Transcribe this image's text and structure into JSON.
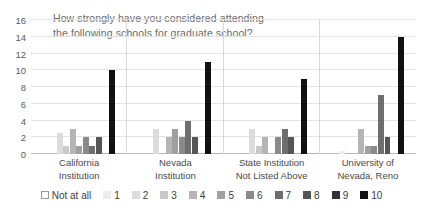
{
  "chart_data": {
    "type": "bar",
    "title": "How strongly have you considered attending\nthe following schools for graduate school?",
    "xlabel": "",
    "ylabel": "",
    "ylim": [
      0,
      16
    ],
    "yticks": [
      0,
      2,
      4,
      6,
      8,
      10,
      12,
      14,
      16
    ],
    "grid": true,
    "legend_position": "bottom",
    "categories": [
      "California\nInstitution",
      "Nevada\nInstitution",
      "State Institution\nNot Listed Above",
      "University of\nNevada, Reno"
    ],
    "series": [
      {
        "name": "Not at all",
        "color": "#ffffff",
        "values": [
          0,
          0,
          0,
          0
        ]
      },
      {
        "name": "1",
        "color": "#ededed",
        "values": [
          0,
          0,
          0,
          0.4
        ]
      },
      {
        "name": "2",
        "color": "#dcdcdc",
        "values": [
          2.5,
          3,
          3,
          0
        ]
      },
      {
        "name": "3",
        "color": "#c9c9c9",
        "values": [
          1,
          0,
          1,
          0
        ]
      },
      {
        "name": "4",
        "color": "#b5b5b5",
        "values": [
          3,
          2,
          2,
          3
        ]
      },
      {
        "name": "5",
        "color": "#a0a0a0",
        "values": [
          1,
          3,
          0,
          1
        ]
      },
      {
        "name": "6",
        "color": "#8a8a8a",
        "values": [
          2,
          2,
          2,
          1
        ]
      },
      {
        "name": "7",
        "color": "#6e6e6e",
        "values": [
          1,
          4,
          3,
          7
        ]
      },
      {
        "name": "8",
        "color": "#555555",
        "values": [
          2,
          2,
          2,
          2
        ]
      },
      {
        "name": "9",
        "color": "#333333",
        "values": [
          0,
          0,
          0,
          0
        ]
      },
      {
        "name": "10",
        "color": "#111111",
        "values": [
          10,
          11,
          9,
          14
        ]
      }
    ]
  },
  "colors": {
    "grid": "#e3e3e3",
    "axis": "#b8b8b8",
    "title_text": "#6b6b6b",
    "tick_text": "#5a5a5a",
    "background": "#ffffff"
  }
}
